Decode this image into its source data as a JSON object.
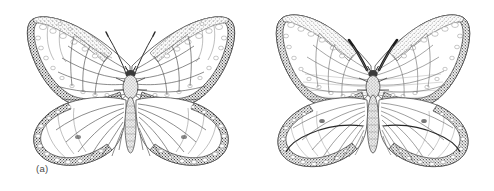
{
  "figure": {
    "type": "scientific-illustration",
    "medium": "pen-and-ink stipple drawing",
    "background_color": "#ffffff",
    "width": 494,
    "height": 191,
    "panel_count": 2
  },
  "panels": [
    {
      "label": "(a)",
      "subject": "butterfly-dorsal-view",
      "label_x": 36,
      "label_y": 163,
      "center_x": 131,
      "center_y": 92,
      "wing_color": "#fdfdfd",
      "border_color": "#3a3a3a",
      "vein_color": "#555555",
      "spot_color": "#ffffff",
      "antennae_style": "thin-curved",
      "hindwing_crossline": false
    },
    {
      "label": "(b)",
      "subject": "butterfly-dorsal-view",
      "label_x": 262,
      "label_y": 163,
      "center_x": 374,
      "center_y": 92,
      "wing_color": "#fdfdfd",
      "border_color": "#3a3a3a",
      "vein_color": "#555555",
      "spot_color": "#ffffff",
      "antennae_style": "thick-dark-clubbed",
      "hindwing_crossline": true
    }
  ],
  "colors": {
    "ink_dark": "#2e2e2e",
    "ink_mid": "#6b6b6b",
    "ink_light": "#9a9a9a",
    "paper": "#ffffff",
    "caption_text": "#4a4a4a"
  }
}
